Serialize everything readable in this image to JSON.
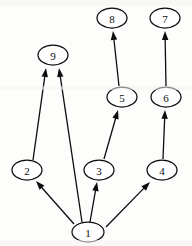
{
  "figure": {
    "width": 192,
    "height": 246,
    "background_color": "#fdfdfc",
    "ink_color": "#0d0d0d"
  },
  "graph": {
    "type": "directed",
    "node_count": 9,
    "edge_count": 9,
    "nodes": [
      {
        "id": "8",
        "label": "8",
        "cx": 112,
        "cy": 18,
        "rx": 15,
        "ry": 10
      },
      {
        "id": "7",
        "label": "7",
        "cx": 165,
        "cy": 18,
        "rx": 15,
        "ry": 10
      },
      {
        "id": "9",
        "label": "9",
        "cx": 53,
        "cy": 55,
        "rx": 15,
        "ry": 10
      },
      {
        "id": "5",
        "label": "5",
        "cx": 122,
        "cy": 97,
        "rx": 15,
        "ry": 10
      },
      {
        "id": "6",
        "label": "6",
        "cx": 166,
        "cy": 97,
        "rx": 15,
        "ry": 10
      },
      {
        "id": "2",
        "label": "2",
        "cx": 27,
        "cy": 170,
        "rx": 15,
        "ry": 10
      },
      {
        "id": "3",
        "label": "3",
        "cx": 99,
        "cy": 170,
        "rx": 15,
        "ry": 10
      },
      {
        "id": "4",
        "label": "4",
        "cx": 162,
        "cy": 170,
        "rx": 15,
        "ry": 10
      },
      {
        "id": "1",
        "label": "1",
        "cx": 88,
        "cy": 232,
        "rx": 16,
        "ry": 10
      }
    ],
    "edges": [
      {
        "from": "2",
        "to": "9",
        "x1": 33,
        "y1": 160,
        "x2": 46,
        "y2": 68,
        "directed": true
      },
      {
        "from": "1",
        "to": "9",
        "x1": 82,
        "y1": 222,
        "x2": 59,
        "y2": 68,
        "directed": true
      },
      {
        "from": "1",
        "to": "2",
        "x1": 74,
        "y1": 224,
        "x2": 36,
        "y2": 181,
        "directed": true
      },
      {
        "from": "1",
        "to": "3",
        "x1": 90,
        "y1": 222,
        "x2": 97,
        "y2": 182,
        "directed": true
      },
      {
        "from": "1",
        "to": "4",
        "x1": 106,
        "y1": 227,
        "x2": 150,
        "y2": 182,
        "directed": true
      },
      {
        "from": "3",
        "to": "5",
        "x1": 104,
        "y1": 159,
        "x2": 118,
        "y2": 110,
        "directed": true
      },
      {
        "from": "4",
        "to": "6",
        "x1": 163,
        "y1": 159,
        "x2": 165,
        "y2": 110,
        "directed": true
      },
      {
        "from": "5",
        "to": "8",
        "x1": 119,
        "y1": 86,
        "x2": 113,
        "y2": 31,
        "directed": true
      },
      {
        "from": "6",
        "to": "7",
        "x1": 166,
        "y1": 86,
        "x2": 165,
        "y2": 31,
        "directed": true
      }
    ]
  }
}
